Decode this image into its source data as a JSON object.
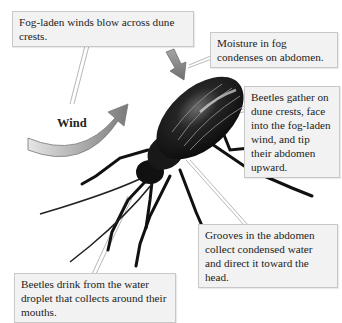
{
  "diagram": {
    "callouts": {
      "fog_winds": "Fog-laden winds blow across dune crests.",
      "moisture": "Moisture in fog condenses on abdomen.",
      "gather": "Beetles gather on dune crests, face into the fog-laden wind, and tip their abdomen upward.",
      "grooves": "Grooves in the abdomen collect condensed water and direct it toward the head.",
      "drink": "Beetles drink from the water droplet that collects around their mouths."
    },
    "wind_label": "Wind",
    "colors": {
      "callout_bg": "#f2f2f2",
      "callout_border": "#c8c8c8",
      "arrow_gray": "#8a8a8a",
      "beetle": "#111111"
    }
  }
}
